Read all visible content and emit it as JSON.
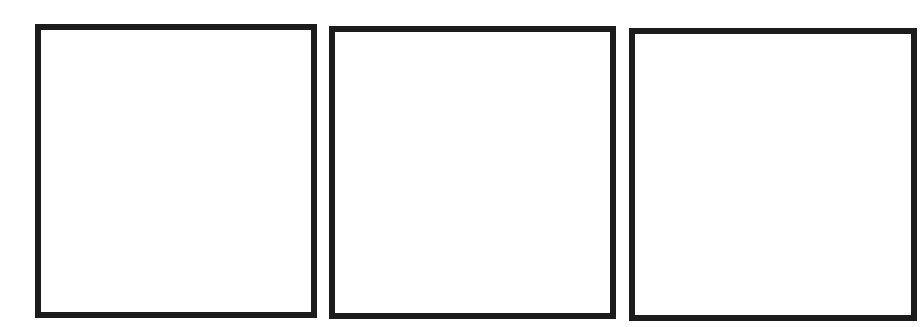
{
  "layout": "three-panel comic strip template",
  "border_color": "#1c1c1c",
  "background_color": "#ffffff",
  "panels": [
    {
      "index": 1,
      "content": ""
    },
    {
      "index": 2,
      "content": ""
    },
    {
      "index": 3,
      "content": ""
    }
  ]
}
